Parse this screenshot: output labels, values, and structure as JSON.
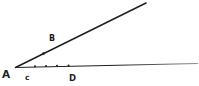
{
  "figure": {
    "type": "geometry-angle-diagram",
    "background_color": "#ffffff",
    "ink_color": "#1f1f1f",
    "faded_line_color": "#909090",
    "vertex": {
      "label": "A",
      "x": 15.5,
      "y": 67.5,
      "label_pos": [
        2,
        77.5
      ]
    },
    "rays": [
      {
        "name": "ray-through-b",
        "from": [
          15.5,
          67.5
        ],
        "to": [
          146,
          3
        ],
        "width": 1.5,
        "stroke": "ink"
      },
      {
        "name": "ray-through-c-d",
        "from": [
          15.5,
          67.5
        ],
        "to": [
          198,
          63.5
        ],
        "width": 1.2,
        "stroke": "fade"
      }
    ],
    "points": [
      {
        "label": "B",
        "dot": [
          43.5,
          53.6
        ],
        "dot_r": 1.3,
        "label_pos": [
          49,
          41
        ]
      },
      {
        "label": "c",
        "dot": [
          35.0,
          66.3
        ],
        "dot_r": 1.05,
        "label_pos": [
          25,
          80
        ]
      },
      {
        "label": "D",
        "dot": [
          68.5,
          65.5
        ],
        "dot_r": 1.05,
        "label_pos": [
          69,
          81
        ]
      }
    ],
    "unlabeled_dots": [
      {
        "x": 46,
        "y": 66.0,
        "r": 1.0
      },
      {
        "x": 57,
        "y": 65.8,
        "r": 1.0
      }
    ]
  }
}
